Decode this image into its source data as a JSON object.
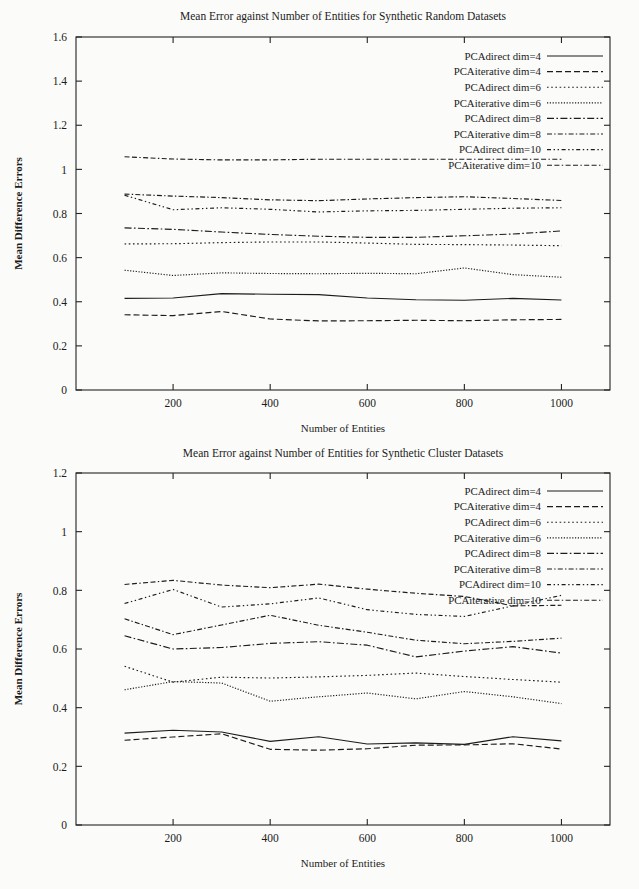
{
  "document": {
    "kind": "two-panel-line-chart-figure",
    "background_color": "#fbfbfa",
    "ink_color": "#1c1c1c"
  },
  "chart_data": [
    {
      "id": "synthetic-random",
      "type": "line",
      "title": "Mean Error against Number of Entities for Synthetic Random Datasets",
      "xlabel": "Number of Entities",
      "ylabel": "Mean Difference Errors",
      "xlim": [
        0,
        1100
      ],
      "ylim": [
        0,
        1.6
      ],
      "xticks": [
        200,
        400,
        600,
        800,
        1000
      ],
      "yticks": [
        0,
        0.2,
        0.4,
        0.6,
        0.8,
        1,
        1.2,
        1.4,
        1.6
      ],
      "ytick_labels": [
        "0",
        "0.2",
        "0.4",
        "0.6",
        "0.8",
        "1",
        "1.2",
        "1.4",
        "1.6"
      ],
      "xtick_labels": [
        "200",
        "400",
        "600",
        "800",
        "1000"
      ],
      "grid": false,
      "legend_position": "top-right inside",
      "x": [
        100,
        200,
        300,
        400,
        500,
        600,
        700,
        800,
        900,
        1000
      ],
      "series": [
        {
          "name": "PCAdirect dim=4",
          "dash": "solid",
          "values": [
            0.415,
            0.417,
            0.437,
            0.434,
            0.432,
            0.417,
            0.409,
            0.407,
            0.415,
            0.408
          ]
        },
        {
          "name": "PCAiterative dim=4",
          "dash": "dashed",
          "values": [
            0.341,
            0.337,
            0.356,
            0.322,
            0.313,
            0.314,
            0.316,
            0.314,
            0.318,
            0.32
          ]
        },
        {
          "name": "PCAdirect dim=6",
          "dash": "fine-dotted",
          "values": [
            0.662,
            0.663,
            0.668,
            0.671,
            0.671,
            0.666,
            0.66,
            0.659,
            0.657,
            0.654
          ]
        },
        {
          "name": "PCAiterative dim=6",
          "dash": "dense-dotted",
          "values": [
            0.543,
            0.519,
            0.531,
            0.528,
            0.527,
            0.529,
            0.527,
            0.553,
            0.523,
            0.511
          ]
        },
        {
          "name": "PCAdirect dim=8",
          "dash": "dash-dot",
          "values": [
            0.735,
            0.728,
            0.716,
            0.705,
            0.697,
            0.692,
            0.692,
            0.699,
            0.707,
            0.721
          ]
        },
        {
          "name": "PCAiterative dim=8",
          "dash": "long-dash-dot",
          "values": [
            0.888,
            0.879,
            0.872,
            0.862,
            0.858,
            0.866,
            0.872,
            0.876,
            0.868,
            0.859
          ]
        },
        {
          "name": "PCAdirect dim=10",
          "dash": "dot-dash-spaced",
          "values": [
            0.883,
            0.817,
            0.826,
            0.819,
            0.807,
            0.812,
            0.814,
            0.819,
            0.824,
            0.826
          ]
        },
        {
          "name": "PCAiterative dim=10",
          "dash": "dash-dash-dot",
          "values": [
            1.057,
            1.047,
            1.043,
            1.043,
            1.046,
            1.046,
            1.046,
            1.046,
            1.046,
            1.046
          ]
        }
      ]
    },
    {
      "id": "synthetic-cluster",
      "type": "line",
      "title": "Mean Error against Number of Entities for Synthetic Cluster Datasets",
      "xlabel": "Number of Entities",
      "ylabel": "Mean Difference Errors",
      "xlim": [
        0,
        1100
      ],
      "ylim": [
        0,
        1.2
      ],
      "xticks": [
        200,
        400,
        600,
        800,
        1000
      ],
      "yticks": [
        0,
        0.2,
        0.4,
        0.6,
        0.8,
        1,
        1.2
      ],
      "ytick_labels": [
        "0",
        "0.2",
        "0.4",
        "0.6",
        "0.8",
        "1",
        "1.2"
      ],
      "xtick_labels": [
        "200",
        "400",
        "600",
        "800",
        "1000"
      ],
      "grid": false,
      "legend_position": "top-right inside",
      "x": [
        100,
        200,
        300,
        400,
        500,
        600,
        700,
        800,
        900,
        1000
      ],
      "series": [
        {
          "name": "PCAdirect dim=4",
          "dash": "solid",
          "values": [
            0.313,
            0.323,
            0.317,
            0.285,
            0.301,
            0.276,
            0.28,
            0.275,
            0.301,
            0.287
          ]
        },
        {
          "name": "PCAiterative dim=4",
          "dash": "dashed",
          "values": [
            0.289,
            0.3,
            0.311,
            0.258,
            0.255,
            0.26,
            0.272,
            0.273,
            0.277,
            0.259
          ]
        },
        {
          "name": "PCAdirect dim=6",
          "dash": "fine-dotted",
          "values": [
            0.541,
            0.487,
            0.504,
            0.501,
            0.505,
            0.51,
            0.518,
            0.506,
            0.496,
            0.487
          ]
        },
        {
          "name": "PCAiterative dim=6",
          "dash": "dense-dotted",
          "values": [
            0.461,
            0.489,
            0.484,
            0.422,
            0.437,
            0.45,
            0.43,
            0.455,
            0.437,
            0.414
          ]
        },
        {
          "name": "PCAdirect dim=8",
          "dash": "dash-dot",
          "values": [
            0.645,
            0.6,
            0.605,
            0.619,
            0.625,
            0.613,
            0.573,
            0.593,
            0.608,
            0.586
          ]
        },
        {
          "name": "PCAiterative dim=8",
          "dash": "long-dash-dot",
          "values": [
            0.703,
            0.649,
            0.682,
            0.715,
            0.681,
            0.657,
            0.63,
            0.618,
            0.626,
            0.637
          ]
        },
        {
          "name": "PCAdirect dim=10",
          "dash": "dot-dash-spaced",
          "values": [
            0.755,
            0.803,
            0.743,
            0.754,
            0.774,
            0.734,
            0.718,
            0.711,
            0.747,
            0.783
          ]
        },
        {
          "name": "PCAiterative dim=10",
          "dash": "dash-dash-dot",
          "values": [
            0.82,
            0.834,
            0.818,
            0.809,
            0.821,
            0.804,
            0.79,
            0.779,
            0.747,
            0.749
          ]
        }
      ]
    }
  ]
}
